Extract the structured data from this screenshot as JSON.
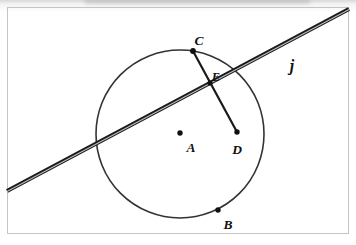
{
  "figure": {
    "labels": {
      "center": "A",
      "pointB": "B",
      "pointC": "C",
      "pointD": "D",
      "pointE": "E",
      "line": "j"
    },
    "colors": {
      "ink": "#1a1a1a",
      "circle_stroke": "#333333",
      "point_fill": "#111111",
      "frame": "#c4c4c4",
      "background": "#ffffff"
    }
  }
}
